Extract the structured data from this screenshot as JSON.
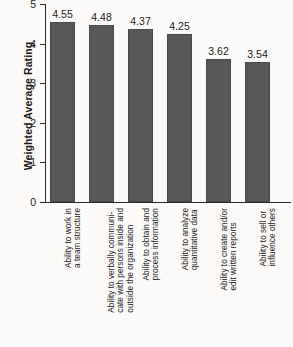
{
  "chart_data": {
    "type": "bar",
    "title": "",
    "xlabel": "",
    "ylabel": "Weighted Average Rating",
    "ylim": [
      0,
      5
    ],
    "ytick_labels": [
      "5",
      "4",
      "3",
      "2",
      "1",
      "0"
    ],
    "yticks": [
      5,
      4,
      3,
      2,
      1,
      0
    ],
    "grid": false,
    "legend": "none",
    "bar_color": "#58585a",
    "categories": [
      "Ability to work in a team structure",
      "Ability to verbally communicate with persons inside and outside the organization",
      "Ability to obtain and process information",
      "Ability to analyze quantitative data",
      "Ability to create and/or edit written reports",
      "Ability to sell or influence others"
    ],
    "category_lines": [
      [
        "Ability to work in",
        "a team structure"
      ],
      [
        "Ability to verbally communi-",
        "cate with persons inside and",
        "outside the organization"
      ],
      [
        "Ability to obtain and",
        "process information"
      ],
      [
        "Ability to analyze",
        "quantitative data"
      ],
      [
        "Ability to create and/or",
        "edit written reports"
      ],
      [
        "Ability to sell or",
        "influence others"
      ]
    ],
    "values": [
      4.55,
      4.48,
      4.37,
      4.25,
      3.62,
      3.54
    ],
    "value_labels": [
      "4.55",
      "4.48",
      "4.37",
      "4.25",
      "3.62",
      "3.54"
    ]
  }
}
